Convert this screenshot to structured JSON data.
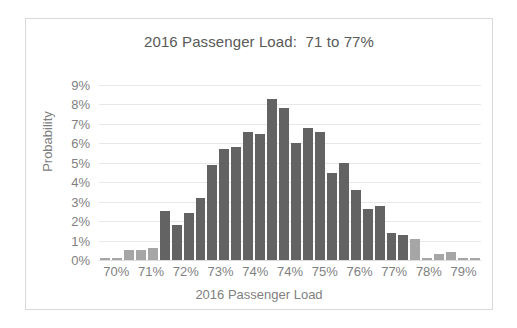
{
  "chart_data": {
    "type": "bar",
    "title": "2016 Passenger Load:  71 to 77%",
    "xlabel": "2016 Passenger Load",
    "ylabel": "Probability",
    "ylim": [
      0,
      9
    ],
    "y_ticks": [
      "0%",
      "1%",
      "2%",
      "3%",
      "4%",
      "5%",
      "6%",
      "7%",
      "8%",
      "9%"
    ],
    "y_tick_values": [
      0,
      1,
      2,
      3,
      4,
      5,
      6,
      7,
      8,
      9
    ],
    "x_tick_labels": [
      "70%",
      "71%",
      "72%",
      "73%",
      "74%",
      "74%",
      "75%",
      "76%",
      "77%",
      "78%",
      "79%"
    ],
    "grid": true,
    "legend": "none",
    "colors": {
      "bar_in_range": "#636363",
      "bar_out_of_range": "#a6a6a6",
      "gridline": "#e8e8e8",
      "axis_text": "#7f7f7f",
      "title_text": "#595959",
      "frame_border": "#d9d9d9",
      "background": "#ffffff"
    },
    "categories": [
      "69.9%",
      "70.2%",
      "70.5%",
      "70.8%",
      "71.1%",
      "71.4%",
      "71.7%",
      "72.0%",
      "72.3%",
      "72.6%",
      "72.9%",
      "73.2%",
      "73.5%",
      "73.8%",
      "74.1%",
      "74.4%",
      "74.7%",
      "75.0%",
      "75.3%",
      "75.6%",
      "75.9%",
      "76.2%",
      "76.5%",
      "76.8%",
      "77.1%",
      "77.4%",
      "77.7%",
      "78.0%",
      "78.3%",
      "78.6%",
      "78.9%",
      "79.2%"
    ],
    "values": [
      0.1,
      0.1,
      0.5,
      0.5,
      0.6,
      2.5,
      1.8,
      2.4,
      3.2,
      4.9,
      5.7,
      5.8,
      6.6,
      6.5,
      8.3,
      7.8,
      6.0,
      6.8,
      6.6,
      4.5,
      5.0,
      3.6,
      2.6,
      2.8,
      1.4,
      1.3,
      1.1,
      0.1,
      0.3,
      0.4,
      0.1,
      0.1
    ],
    "highlighted": [
      false,
      false,
      false,
      false,
      false,
      true,
      true,
      true,
      true,
      true,
      true,
      true,
      true,
      true,
      true,
      true,
      true,
      true,
      true,
      true,
      true,
      true,
      true,
      true,
      true,
      true,
      false,
      false,
      false,
      false,
      false,
      false
    ],
    "highlight_range": {
      "from": "71%",
      "to": "77%"
    }
  }
}
